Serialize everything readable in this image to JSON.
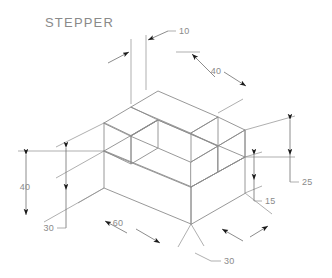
{
  "drawing": {
    "title": "STEPPER",
    "background_color": "#ffffff",
    "line_color": "#8c8c8c",
    "text_color": "#8a8a8a",
    "arrow_color": "#1a1a1a",
    "projection": "isometric",
    "object_type": "stepped-block",
    "dimensions": [
      {
        "id": "width-10",
        "label": "10",
        "orientation": "vertical-pair-top",
        "feature": "step wall thickness"
      },
      {
        "id": "length-40",
        "label": "40",
        "orientation": "iso-right",
        "feature": "top rear edge length"
      },
      {
        "id": "height-25",
        "label": "25",
        "orientation": "vertical-right-outer",
        "feature": "overall height at right"
      },
      {
        "id": "height-15",
        "label": "15",
        "orientation": "vertical-right-inner",
        "feature": "base slab height"
      },
      {
        "id": "depth-30-right",
        "label": "30",
        "orientation": "iso-right-bottom",
        "feature": "base depth right"
      },
      {
        "id": "length-60",
        "label": "60",
        "orientation": "iso-left-bottom",
        "feature": "base overall length"
      },
      {
        "id": "height-40",
        "label": "40",
        "orientation": "vertical-left-outer",
        "feature": "overall height at left"
      },
      {
        "id": "height-30",
        "label": "30",
        "orientation": "vertical-left-inner",
        "feature": "inner height at left"
      }
    ]
  }
}
